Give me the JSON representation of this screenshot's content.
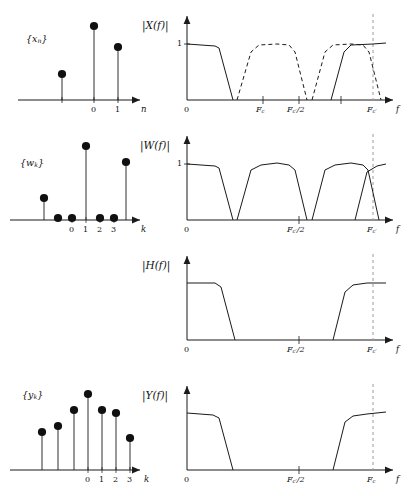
{
  "figure": {
    "type": "signal-processing-diagram",
    "rows": [
      {
        "id": "row-x",
        "time": {
          "label": "{x_n}",
          "axis_name": "n",
          "ticks": [
            "0",
            "1"
          ],
          "stems": [
            {
              "k": -1,
              "h": 0.42
            },
            {
              "k": 0,
              "h": 1.0
            },
            {
              "k": 1,
              "h": 0.72
            }
          ]
        },
        "spectrum": {
          "label": "|X(f)|",
          "axis_name": "f",
          "ylabel": "1",
          "ticks": [
            "0",
            "Fc",
            "Fc'/2",
            "Fc'"
          ],
          "style": "solid-edges-dashed-humps"
        }
      },
      {
        "id": "row-w",
        "time": {
          "label": "{w_k}",
          "axis_name": "k",
          "ticks": [
            "0",
            "1",
            "2",
            "3"
          ],
          "stems": [
            {
              "k": -2,
              "h": 0.33
            },
            {
              "k": -1,
              "h": 0.05
            },
            {
              "k": 0,
              "h": 0.05
            },
            {
              "k": 1,
              "h": 1.0
            },
            {
              "k": 2,
              "h": 0.05
            },
            {
              "k": 3,
              "h": 0.05
            },
            {
              "k": 4,
              "h": 0.78
            }
          ]
        },
        "spectrum": {
          "label": "|W(f)|",
          "axis_name": "f",
          "ylabel": "1",
          "ticks": [
            "0",
            "Fc'/2",
            "Fc'"
          ],
          "style": "solid-four-humps"
        }
      },
      {
        "id": "row-h",
        "time": null,
        "spectrum": {
          "label": "|H(f)|",
          "axis_name": "f",
          "ylabel": "",
          "ticks": [
            "0",
            "Fc'/2",
            "Fc'"
          ],
          "style": "solid-band-edges-flat"
        }
      },
      {
        "id": "row-y",
        "time": {
          "label": "{y_k}",
          "axis_name": "k",
          "ticks": [
            "0",
            "1",
            "2",
            "3"
          ],
          "stems": [
            {
              "k": -3,
              "h": 0.47
            },
            {
              "k": -2,
              "h": 0.56
            },
            {
              "k": -1,
              "h": 0.76
            },
            {
              "k": 0,
              "h": 1.0
            },
            {
              "k": 1,
              "h": 0.76
            },
            {
              "k": 2,
              "h": 0.72
            },
            {
              "k": 3,
              "h": 0.38
            }
          ]
        },
        "spectrum": {
          "label": "|Y(f)|",
          "axis_name": "f",
          "ylabel": "",
          "ticks": [
            "0",
            "Fc'/2",
            "Fc"
          ],
          "style": "solid-band-edges-sloped"
        }
      }
    ],
    "colors": {
      "line": "#1a1a1a",
      "dashed_guide": "#9a9a9a",
      "stem_dot": "#101010",
      "background": "#ffffff"
    }
  },
  "labels": {
    "x_seq": "{x",
    "x_sub": "n",
    "w_seq": "{w",
    "w_sub": "k",
    "y_seq": "{y",
    "y_sub": "k",
    "close": "}",
    "abs": "|",
    "Xf": "X(f)",
    "Wf": "W(f)",
    "Hf": "H(f)",
    "Yf": "Y(f)",
    "one": "1",
    "zero": "0",
    "n_axis": "n",
    "k_axis": "k",
    "f_axis": "f",
    "tick0": "0",
    "tick1": "1",
    "tick2": "2",
    "tick3": "3",
    "F": "F",
    "c": "c",
    "cprime": "c",
    "prime": "′",
    "half": "/2",
    "Fc": "F",
    "Fc_sub": "c",
    "Fcp_half_sub": "c′",
    "Fcp_half_tail": "/2",
    "Fcp_sub": "c′"
  }
}
